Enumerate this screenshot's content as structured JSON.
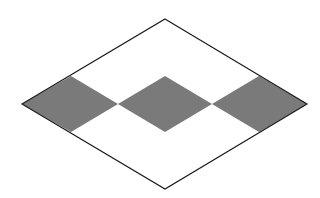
{
  "diagram": {
    "type": "geometric-figure",
    "canvas": {
      "width": 320,
      "height": 198,
      "background": "#ffffff"
    },
    "outer_rhombus": {
      "points": [
        [
          165,
          19
        ],
        [
          307,
          104
        ],
        [
          165,
          189
        ],
        [
          22,
          104
        ]
      ],
      "fill": "#ffffff",
      "stroke": "#1a1a1a",
      "stroke_width": 1.2
    },
    "shaded_regions": [
      {
        "name": "left-shaded",
        "points": [
          [
            22,
            104
          ],
          [
            71,
            76
          ],
          [
            118,
            104
          ],
          [
            71,
            132
          ]
        ],
        "fill": "#7a7a7a"
      },
      {
        "name": "center-shaded",
        "points": [
          [
            118,
            104
          ],
          [
            165,
            76
          ],
          [
            212,
            104
          ],
          [
            165,
            132
          ]
        ],
        "fill": "#7a7a7a"
      },
      {
        "name": "right-shaded",
        "points": [
          [
            212,
            104
          ],
          [
            259,
            76
          ],
          [
            307,
            104
          ],
          [
            259,
            132
          ]
        ],
        "fill": "#7a7a7a"
      }
    ]
  }
}
